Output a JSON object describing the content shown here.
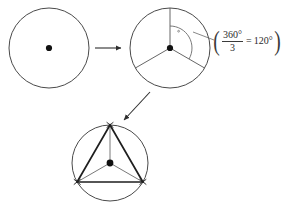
{
  "diagram": {
    "title": "Constructing an inscribed equilateral triangle in a circle",
    "background_color": "#ffffff",
    "stroke_color": "#3a3a3a",
    "accent_stroke_color": "#1a1a1a",
    "point_color": "#111111",
    "steps": [
      {
        "id": "step-1",
        "name": "plain-circle",
        "label": "Circle with center point",
        "center": [
          49,
          48
        ],
        "radius": 40
      },
      {
        "id": "step-2",
        "name": "circle-with-three-radii",
        "label": "Circle divided by three radii 120 degrees apart",
        "center": [
          170,
          48
        ],
        "radius": 40,
        "radii_angles_deg": [
          90,
          210,
          330
        ]
      },
      {
        "id": "step-3",
        "name": "inscribed-equilateral-triangle",
        "label": "Equilateral triangle inscribed in circle",
        "center": [
          110,
          163
        ],
        "radius": 38,
        "vertex_angles_deg": [
          90,
          210,
          330
        ]
      }
    ],
    "arrows": [
      {
        "name": "arrow-step1-to-step2",
        "from": [
          95,
          48
        ],
        "to": [
          124,
          48
        ],
        "direction": "right"
      },
      {
        "name": "arrow-step2-to-step3",
        "from": [
          150,
          92
        ],
        "to": [
          122,
          122
        ],
        "direction": "down-left"
      }
    ],
    "angle_arc": {
      "name": "central-angle-arc",
      "vertex": [
        170,
        48
      ],
      "start_angle_deg": 90,
      "end_angle_deg": 330,
      "radius": 22,
      "measure": "120"
    },
    "leader_line": {
      "name": "angle-leader-line",
      "from": [
        193,
        32
      ],
      "to": [
        214,
        40
      ]
    },
    "annotation": {
      "name": "central-angle-formula",
      "open_paren": "(",
      "numerator": "360°",
      "denominator": "3",
      "equals": "=",
      "result": "120°",
      "close_paren": ")",
      "full_text": "(360° / 3 = 120°)"
    }
  }
}
